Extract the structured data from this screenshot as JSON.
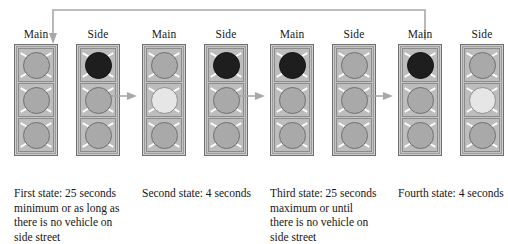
{
  "diagram": {
    "type": "state-transition-diagram",
    "colors": {
      "lamp_off": "#a9a9a9",
      "lamp_red_lit": "#1e1e1e",
      "lamp_yellow_lit": "#e6e6e6",
      "housing": "#cfcfcf",
      "arrow": "#a8a8a8",
      "text": "#161616"
    },
    "signal_labels": {
      "main": "Main",
      "side": "Side"
    },
    "lamp_order": [
      "top",
      "middle",
      "bottom"
    ],
    "states": [
      {
        "id": "state-1",
        "caption": "First state:  25 seconds\nminimum or as long as\nthere is no vehicle on\nside street",
        "ordinal": "First state:",
        "duration": "25 seconds minimum or as long as there is no vehicle on side street",
        "main": [
          "off",
          "off",
          "off"
        ],
        "side": [
          "red",
          "off",
          "off"
        ]
      },
      {
        "id": "state-2",
        "caption": "Second state:  4 seconds",
        "ordinal": "Second state:",
        "duration": "4 seconds",
        "main": [
          "off",
          "yellow",
          "off"
        ],
        "side": [
          "red",
          "off",
          "off"
        ]
      },
      {
        "id": "state-3",
        "caption": "Third state:  25 seconds\nmaximum or until\nthere is no vehicle on\nside street",
        "ordinal": "Third state:",
        "duration": "25 seconds maximum or until there is no vehicle on side street",
        "main": [
          "red",
          "off",
          "off"
        ],
        "side": [
          "off",
          "off",
          "off"
        ]
      },
      {
        "id": "state-4",
        "caption": "Fourth state:  4 seconds",
        "ordinal": "Fourth state:",
        "duration": "4 seconds",
        "main": [
          "red",
          "off",
          "off"
        ],
        "side": [
          "off",
          "yellow",
          "off"
        ]
      }
    ],
    "transitions": [
      {
        "from": "state-1",
        "to": "state-2",
        "kind": "forward"
      },
      {
        "from": "state-2",
        "to": "state-3",
        "kind": "forward"
      },
      {
        "from": "state-3",
        "to": "state-4",
        "kind": "forward"
      },
      {
        "from": "state-4",
        "to": "state-1",
        "kind": "feedback-loop"
      }
    ]
  }
}
